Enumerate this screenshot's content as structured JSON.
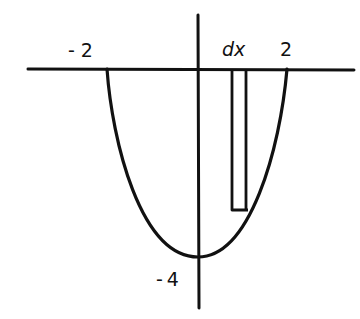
{
  "diagram": {
    "labels": {
      "x_left_root": "-2",
      "x_right_root": "2",
      "dx": "dx",
      "y_min": "-4"
    },
    "colors": {
      "ink": "#111111",
      "background": "#ffffff"
    },
    "curve": {
      "function": "y = x^2 - 4",
      "x_range": [
        -2,
        2
      ],
      "vertex": [
        0,
        -4
      ]
    },
    "strip": {
      "label": "dx",
      "description": "thin vertical rectangle between x-axis and curve"
    }
  }
}
